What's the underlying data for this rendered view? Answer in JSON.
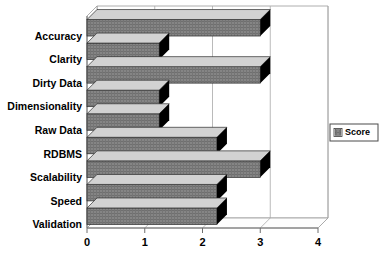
{
  "chart_data": {
    "type": "bar",
    "orientation": "horizontal",
    "style": "3d",
    "title": "",
    "subtitle": "",
    "xlabel": "",
    "ylabel": "",
    "categories": [
      "Accuracy",
      "Clarity",
      "Dirty Data",
      "Dimensionality",
      "Raw Data",
      "RDBMS",
      "Scalability",
      "Speed",
      "Validation"
    ],
    "values": [
      3,
      1.25,
      3,
      1.25,
      1.25,
      2.25,
      3,
      2.25,
      2.25
    ],
    "series": [
      {
        "name": "Score",
        "values": [
          3,
          1.25,
          3,
          1.25,
          1.25,
          2.25,
          3,
          2.25,
          2.25
        ]
      }
    ],
    "xlim": [
      0,
      4
    ],
    "xticks": [
      0,
      1,
      2,
      3,
      4
    ],
    "xtick_labels": [
      "0",
      "1",
      "2",
      "3",
      "4"
    ],
    "grid": true,
    "grid_axis": "x",
    "legend": {
      "position": "right",
      "entries": [
        {
          "label": "Score",
          "color": "#808080",
          "swatch": "legend-swatch-icon"
        }
      ]
    },
    "colors": {
      "bar_front": "#808080",
      "bar_top": "#d2d2d2",
      "bar_side": "#3a3a3a",
      "bar_outline": "#2b2b2b",
      "plot_background": "#ffffff",
      "gridline": "#a8a8a8",
      "axis": "#6e6e6e",
      "text": "#000000"
    }
  }
}
